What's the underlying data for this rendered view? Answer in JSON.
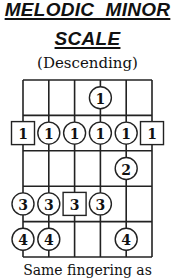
{
  "header": {
    "title_line1": "MELODIC  MINOR",
    "title_line2": "SCALE",
    "subtitle": "(Descending)"
  },
  "footer": {
    "text": "Same fingering as"
  },
  "diagram": {
    "strings": 6,
    "frets": 5,
    "markers": [
      {
        "fret": 1,
        "string": 4,
        "finger": "1",
        "shape": "circle"
      },
      {
        "fret": 2,
        "string": 1,
        "finger": "1",
        "shape": "square"
      },
      {
        "fret": 2,
        "string": 2,
        "finger": "1",
        "shape": "circle"
      },
      {
        "fret": 2,
        "string": 3,
        "finger": "1",
        "shape": "circle"
      },
      {
        "fret": 2,
        "string": 4,
        "finger": "1",
        "shape": "circle"
      },
      {
        "fret": 2,
        "string": 5,
        "finger": "1",
        "shape": "circle"
      },
      {
        "fret": 2,
        "string": 6,
        "finger": "1",
        "shape": "square"
      },
      {
        "fret": 3,
        "string": 5,
        "finger": "2",
        "shape": "circle"
      },
      {
        "fret": 4,
        "string": 1,
        "finger": "3",
        "shape": "circle"
      },
      {
        "fret": 4,
        "string": 2,
        "finger": "3",
        "shape": "circle"
      },
      {
        "fret": 4,
        "string": 3,
        "finger": "3",
        "shape": "square"
      },
      {
        "fret": 4,
        "string": 4,
        "finger": "3",
        "shape": "circle"
      },
      {
        "fret": 5,
        "string": 1,
        "finger": "4",
        "shape": "circle"
      },
      {
        "fret": 5,
        "string": 2,
        "finger": "4",
        "shape": "circle"
      },
      {
        "fret": 5,
        "string": 5,
        "finger": "4",
        "shape": "circle"
      }
    ]
  }
}
